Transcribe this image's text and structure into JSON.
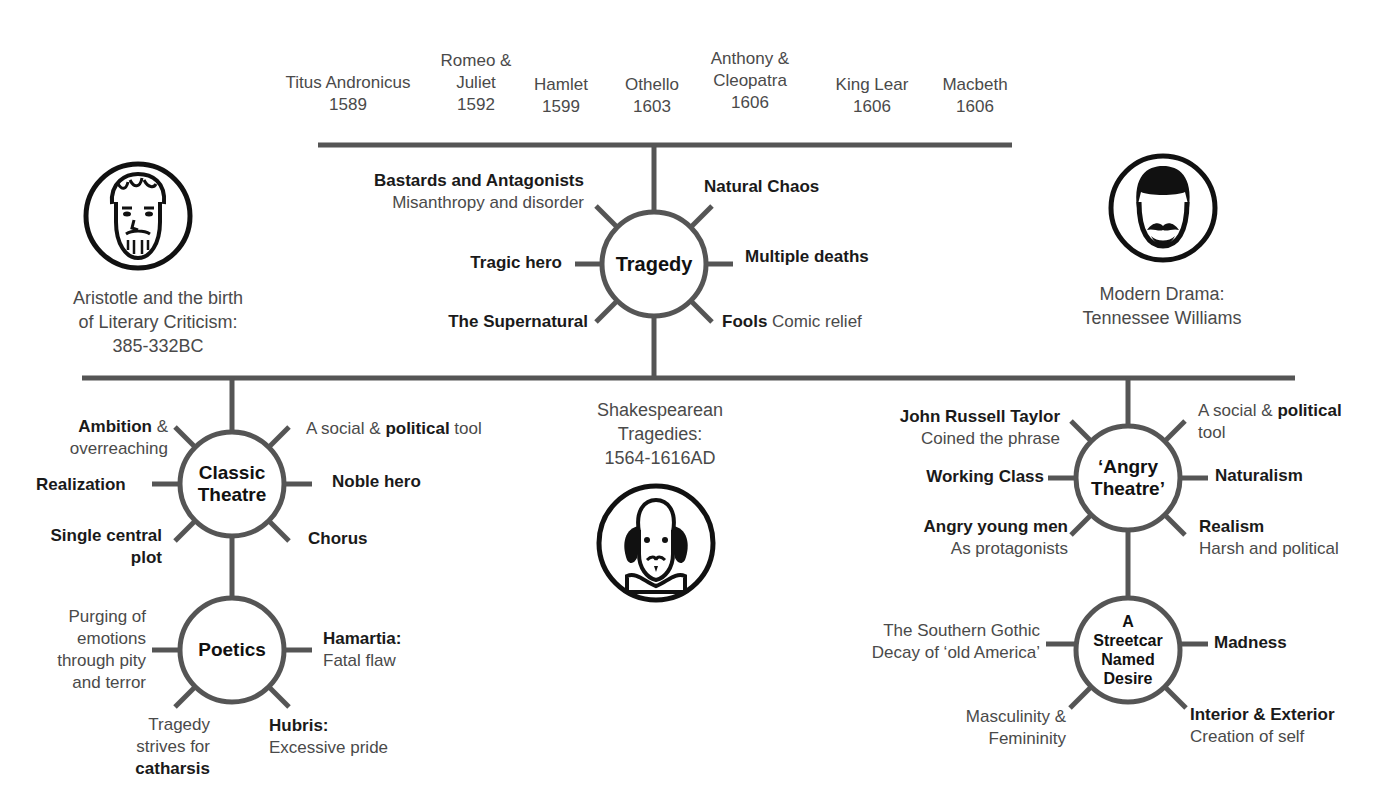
{
  "timeline": {
    "plays": [
      {
        "title": "Titus Andronicus",
        "year": "1589"
      },
      {
        "title_line1": "Romeo &",
        "title_line2": "Juliet",
        "year": "1592"
      },
      {
        "title": "Hamlet",
        "year": "1599"
      },
      {
        "title": "Othello",
        "year": "1603"
      },
      {
        "title_line1": "Anthony &",
        "title_line2": "Cleopatra",
        "year": "1606"
      },
      {
        "title": "King Lear",
        "year": "1606"
      },
      {
        "title": "Macbeth",
        "year": "1606"
      }
    ]
  },
  "tragedy": {
    "hub": "Tragedy",
    "spokes": {
      "bastards_bold": "Bastards and Antagonists",
      "bastards_sub": "Misanthropy and disorder",
      "natural_chaos": "Natural Chaos",
      "tragic_hero": "Tragic hero",
      "multiple_deaths": "Multiple deaths",
      "supernatural": "The Supernatural",
      "fools_bold": "Fools",
      "fools_sub": "Comic relief"
    }
  },
  "aristotle": {
    "icon": "aristotle-portrait-icon",
    "caption_line1": "Aristotle and the birth",
    "caption_line2": "of Literary Criticism:",
    "caption_line3": "385-332BC"
  },
  "modern": {
    "icon": "tennessee-williams-portrait-icon",
    "caption_line1": "Modern Drama:",
    "caption_line2": "Tennessee Williams"
  },
  "shakespeare": {
    "icon": "shakespeare-portrait-icon",
    "caption_line1": "Shakespearean",
    "caption_line2": "Tragedies:",
    "caption_line3": "1564-1616AD"
  },
  "classic": {
    "hub_line1": "Classic",
    "hub_line2": "Theatre",
    "spokes": {
      "ambition_bold": "Ambition",
      "ambition_rest": " &",
      "ambition_line2": "overreaching",
      "social_pre": "A social & ",
      "social_bold": "political",
      "social_post": " tool",
      "realization": "Realization",
      "noble_hero": "Noble hero",
      "single_line1": "Single central",
      "single_line2": "plot",
      "chorus": "Chorus"
    }
  },
  "poetics": {
    "hub": "Poetics",
    "spokes": {
      "purging_line1": "Purging of",
      "purging_line2": "emotions",
      "purging_line3": "through pity",
      "purging_line4": "and terror",
      "hamartia_bold": "Hamartia:",
      "hamartia_sub": "Fatal flaw",
      "tragedy_line1": "Tragedy",
      "tragedy_line2": "strives for",
      "tragedy_bold": "catharsis",
      "hubris_bold": "Hubris:",
      "hubris_sub": "Excessive pride"
    }
  },
  "angry": {
    "hub_line1": "‘Angry",
    "hub_line2": "Theatre’",
    "spokes": {
      "jrt_bold": "John Russell Taylor",
      "jrt_sub": "Coined the phrase",
      "social_pre": "A social & ",
      "social_bold": "political",
      "social_line2": "tool",
      "working_class": "Working Class",
      "naturalism": "Naturalism",
      "angry_bold": "Angry young men",
      "angry_sub": "As protagonists",
      "realism_bold": "Realism",
      "realism_sub": "Harsh and political"
    }
  },
  "streetcar": {
    "hub_line1": "A",
    "hub_line2": "Streetcar",
    "hub_line3": "Named",
    "hub_line4": "Desire",
    "spokes": {
      "gothic_line1": "The Southern Gothic",
      "gothic_line2": "Decay of ‘old America’",
      "madness": "Madness",
      "masc_line1": "Masculinity &",
      "masc_line2": "Femininity",
      "interior_bold": "Interior & Exterior",
      "interior_sub": "Creation of self"
    }
  },
  "colors": {
    "line": "#555555",
    "text": "#4a4a4a",
    "bold_text": "#1a1a1a",
    "icon": "#111111"
  }
}
